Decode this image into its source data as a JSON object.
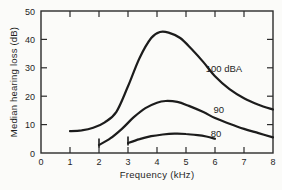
{
  "colors": {
    "background": "#fbfbf9",
    "axis": "#2b2b2b",
    "curve": "#1c1c1c",
    "text": "#1f1f1f"
  },
  "chart_data": {
    "type": "line",
    "title": "",
    "xlabel": "Frequency (kHz)",
    "ylabel": "Median hearing loss (dB)",
    "xlim": [
      0,
      8
    ],
    "ylim": [
      0,
      50
    ],
    "xticks": [
      0,
      1,
      2,
      3,
      4,
      5,
      6,
      7,
      8
    ],
    "yticks": [
      0,
      10,
      20,
      30,
      40,
      50
    ],
    "grid": false,
    "legend_position": "inline-labels",
    "series": [
      {
        "name": "100 dBA",
        "start_cap": false,
        "points": [
          [
            1,
            7.7
          ],
          [
            1.4,
            8.0
          ],
          [
            1.8,
            8.9
          ],
          [
            2.2,
            10.8
          ],
          [
            2.6,
            14.5
          ],
          [
            3.0,
            23.5
          ],
          [
            3.4,
            33.5
          ],
          [
            3.8,
            40.5
          ],
          [
            4.1,
            42.6
          ],
          [
            4.4,
            42.4
          ],
          [
            4.8,
            40.5
          ],
          [
            5.2,
            36.5
          ],
          [
            5.6,
            32.0
          ],
          [
            6.0,
            27.0
          ],
          [
            6.5,
            22.5
          ],
          [
            7.0,
            19.3
          ],
          [
            7.5,
            17.0
          ],
          [
            8.0,
            15.3
          ]
        ]
      },
      {
        "name": "90",
        "start_cap": true,
        "points": [
          [
            2.0,
            2.8
          ],
          [
            2.4,
            5.2
          ],
          [
            2.8,
            8.6
          ],
          [
            3.2,
            12.6
          ],
          [
            3.6,
            15.8
          ],
          [
            4.0,
            17.7
          ],
          [
            4.3,
            18.3
          ],
          [
            4.7,
            18.0
          ],
          [
            5.1,
            16.6
          ],
          [
            5.6,
            14.4
          ],
          [
            6.0,
            12.3
          ],
          [
            6.5,
            10.3
          ],
          [
            7.0,
            8.5
          ],
          [
            7.5,
            7.0
          ],
          [
            8.0,
            5.5
          ]
        ]
      },
      {
        "name": "80",
        "start_cap": true,
        "points": [
          [
            3.0,
            3.5
          ],
          [
            3.4,
            4.9
          ],
          [
            3.8,
            5.9
          ],
          [
            4.2,
            6.5
          ],
          [
            4.6,
            6.8
          ],
          [
            5.0,
            6.7
          ],
          [
            5.4,
            6.3
          ],
          [
            5.7,
            5.8
          ],
          [
            6.0,
            5.0
          ]
        ]
      }
    ],
    "annotations": [
      {
        "text": "100 dBA",
        "x": 5.68,
        "y": 28.5
      },
      {
        "text": "90",
        "x": 5.95,
        "y": 14.2
      },
      {
        "text": "80",
        "x": 5.85,
        "y": 5.6
      }
    ]
  }
}
